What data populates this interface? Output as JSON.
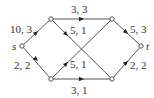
{
  "diagram": {
    "type": "flow-network",
    "nodes": [
      {
        "id": "s",
        "label": "s",
        "x": 22,
        "y": 46
      },
      {
        "id": "a",
        "label": "",
        "x": 51,
        "y": 19
      },
      {
        "id": "b",
        "label": "",
        "x": 112,
        "y": 19
      },
      {
        "id": "c",
        "label": "",
        "x": 51,
        "y": 79
      },
      {
        "id": "d",
        "label": "",
        "x": 112,
        "y": 79
      },
      {
        "id": "t",
        "label": "t",
        "x": 141,
        "y": 46
      }
    ],
    "edges": [
      {
        "from": "s",
        "to": "a",
        "label": "10, 3"
      },
      {
        "from": "s",
        "to": "c",
        "label": "2, 2"
      },
      {
        "from": "a",
        "to": "b",
        "label": "3, 3"
      },
      {
        "from": "c",
        "to": "d",
        "label": "3, 1"
      },
      {
        "from": "a",
        "to": "d",
        "label": "5, 1"
      },
      {
        "from": "c",
        "to": "b",
        "label": "5, 1"
      },
      {
        "from": "b",
        "to": "t",
        "label": "5, 3"
      },
      {
        "from": "d",
        "to": "t",
        "label": "2, 2"
      }
    ]
  }
}
